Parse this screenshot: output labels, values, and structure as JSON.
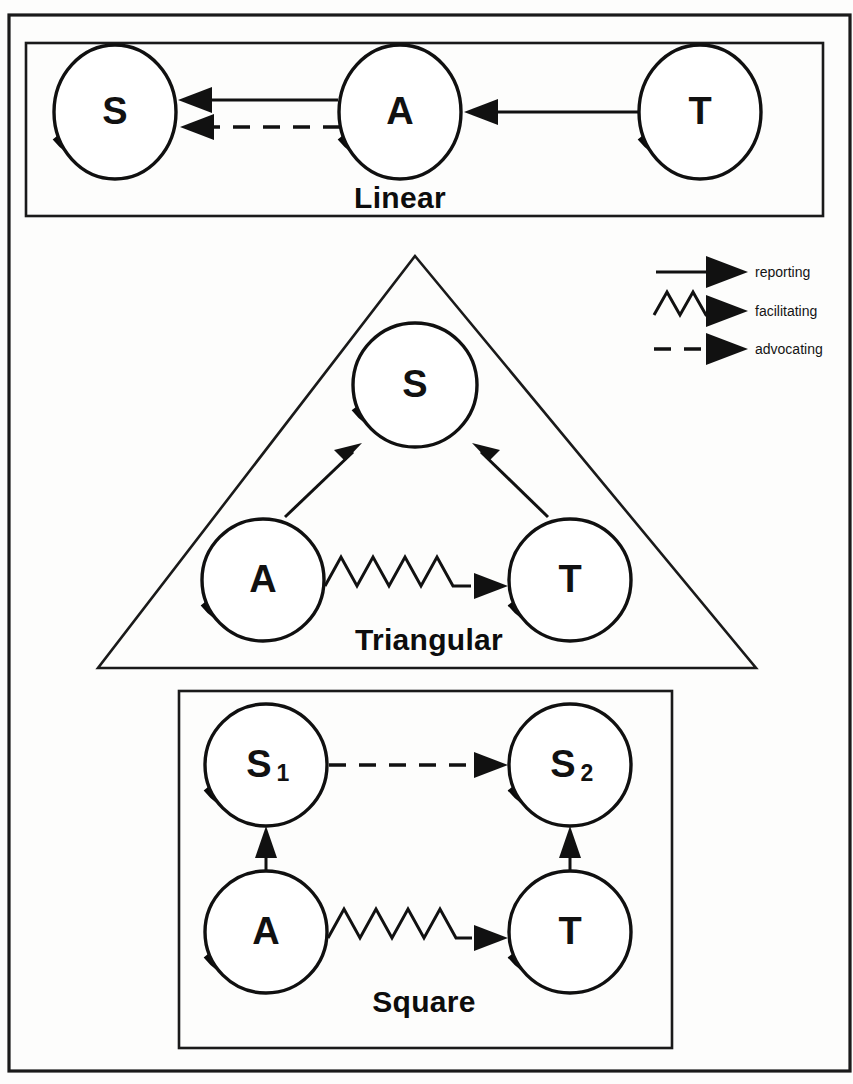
{
  "figure": {
    "background_color": "#fdfdfc",
    "ink_color": "#111111"
  },
  "panels": [
    {
      "id": "linear",
      "caption": "Linear",
      "shape": "rectangle",
      "nodes": [
        {
          "id": "linear-s",
          "label": "S",
          "subscript": "",
          "cx": 115,
          "cy": 112,
          "r": 62
        },
        {
          "id": "linear-a",
          "label": "A",
          "subscript": "",
          "cx": 400,
          "cy": 112,
          "r": 62
        },
        {
          "id": "linear-t",
          "label": "T",
          "subscript": "",
          "cx": 700,
          "cy": 112,
          "r": 62
        }
      ],
      "edges": [
        {
          "from": "A",
          "to": "S",
          "type": "reporting",
          "style": "solid"
        },
        {
          "from": "A",
          "to": "S",
          "type": "advocating",
          "style": "dashed"
        },
        {
          "from": "T",
          "to": "A",
          "type": "reporting",
          "style": "solid"
        }
      ]
    },
    {
      "id": "triangular",
      "caption": "Triangular",
      "shape": "triangle",
      "nodes": [
        {
          "id": "tri-s",
          "label": "S",
          "subscript": "",
          "cx": 415,
          "cy": 385,
          "r": 63
        },
        {
          "id": "tri-a",
          "label": "A",
          "subscript": "",
          "cx": 263,
          "cy": 580,
          "r": 62
        },
        {
          "id": "tri-t",
          "label": "T",
          "subscript": "",
          "cx": 570,
          "cy": 580,
          "r": 62
        }
      ],
      "edges": [
        {
          "from": "A",
          "to": "S",
          "type": "reporting",
          "style": "solid"
        },
        {
          "from": "T",
          "to": "S",
          "type": "reporting",
          "style": "solid"
        },
        {
          "from": "A",
          "to": "T",
          "type": "facilitating",
          "style": "zigzag"
        }
      ]
    },
    {
      "id": "square",
      "caption": "Square",
      "shape": "rectangle",
      "nodes": [
        {
          "id": "sq-s1",
          "label": "S",
          "subscript": "1",
          "cx": 266,
          "cy": 765,
          "r": 62
        },
        {
          "id": "sq-s2",
          "label": "S",
          "subscript": "2",
          "cx": 570,
          "cy": 765,
          "r": 62
        },
        {
          "id": "sq-a",
          "label": "A",
          "subscript": "",
          "cx": 266,
          "cy": 932,
          "r": 62
        },
        {
          "id": "sq-t",
          "label": "T",
          "subscript": "",
          "cx": 570,
          "cy": 932,
          "r": 62
        }
      ],
      "edges": [
        {
          "from": "S1",
          "to": "S2",
          "type": "advocating",
          "style": "dashed"
        },
        {
          "from": "A",
          "to": "S1",
          "type": "reporting",
          "style": "solid"
        },
        {
          "from": "T",
          "to": "S2",
          "type": "reporting",
          "style": "solid"
        },
        {
          "from": "A",
          "to": "T",
          "type": "facilitating",
          "style": "zigzag"
        }
      ]
    }
  ],
  "legend": {
    "items": [
      {
        "id": "reporting",
        "label": "reporting",
        "style": "solid"
      },
      {
        "id": "facilitating",
        "label": "facilitating",
        "style": "zigzag"
      },
      {
        "id": "advocating",
        "label": "advocating",
        "style": "dashed"
      }
    ]
  }
}
